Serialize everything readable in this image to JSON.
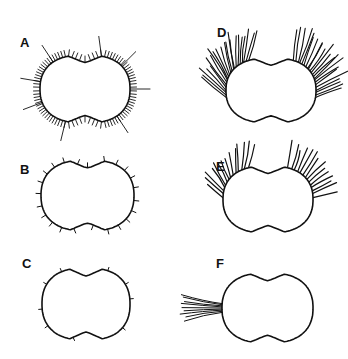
{
  "figure": {
    "ink_color": "#111111",
    "background": "#ffffff",
    "panels": [
      {
        "id": "A",
        "label": "A",
        "label_pos": [
          20,
          36
        ],
        "box": [
          40,
          55,
          130,
          123
        ],
        "pattern": "dense-short-with-long-spines"
      },
      {
        "id": "B",
        "label": "B",
        "label_pos": [
          20,
          163
        ],
        "box": [
          41,
          160,
          134,
          231
        ],
        "pattern": "sparse-short"
      },
      {
        "id": "C",
        "label": "C",
        "label_pos": [
          22,
          257
        ],
        "box": [
          42,
          268,
          130,
          340
        ],
        "pattern": "very-sparse-tiny"
      },
      {
        "id": "D",
        "label": "D",
        "label_pos": [
          217,
          26
        ],
        "box": [
          226,
          58,
          316,
          123
        ],
        "pattern": "two-large-tufts-top"
      },
      {
        "id": "E",
        "label": "E",
        "label_pos": [
          216,
          160
        ],
        "box": [
          223,
          166,
          313,
          233
        ],
        "pattern": "two-small-tufts-top"
      },
      {
        "id": "F",
        "label": "F",
        "label_pos": [
          216,
          257
        ],
        "box": [
          222,
          273,
          313,
          343
        ],
        "pattern": "single-tuft-left"
      }
    ]
  }
}
